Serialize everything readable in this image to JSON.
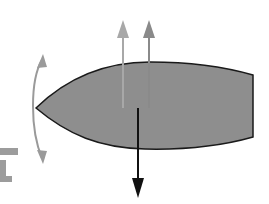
{
  "diagram": {
    "colors": {
      "background": "#ffffff",
      "body_fill": "#8e8e8e",
      "body_stroke": "#1a1a1a",
      "arrow_up_light": "#a8a8a8",
      "arrow_up_dark": "#8a8a8a",
      "arrow_down": "#111111",
      "pivot_arc": "#9a9a9a",
      "partial_symbol": "#9c9c9c"
    },
    "elements": [
      {
        "id": "body",
        "label": "Lens-shaped body with flat trailing edge"
      },
      {
        "id": "arrow-up-left",
        "label": "Upward force (light)"
      },
      {
        "id": "arrow-up-right",
        "label": "Upward force (darker)"
      },
      {
        "id": "arrow-down",
        "label": "Downward force"
      },
      {
        "id": "pivot-arc",
        "label": "Curved double-headed rotation arrow at nose"
      },
      {
        "id": "partial-symbol",
        "label": "Partially visible grey shape"
      }
    ]
  }
}
